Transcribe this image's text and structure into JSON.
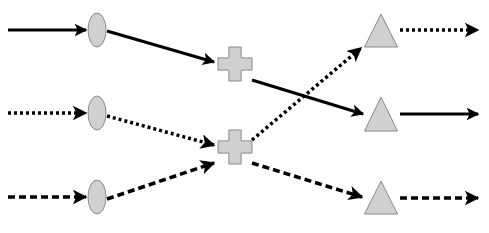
{
  "diagram": {
    "type": "flow-network",
    "colors": {
      "node_fill": "#d0d0d0",
      "node_stroke": "#8a8a8a",
      "edge": "#000000",
      "background": "#ffffff"
    },
    "nodes": [
      {
        "id": "in1",
        "shape": "ellipse",
        "cx": 97,
        "cy": 30,
        "rx": 9,
        "ry": 17
      },
      {
        "id": "in2",
        "shape": "ellipse",
        "cx": 97,
        "cy": 113,
        "rx": 9,
        "ry": 17
      },
      {
        "id": "in3",
        "shape": "ellipse",
        "cx": 97,
        "cy": 197,
        "rx": 9,
        "ry": 17
      },
      {
        "id": "mid1",
        "shape": "cross",
        "cx": 235,
        "cy": 64,
        "size": 34
      },
      {
        "id": "mid2",
        "shape": "cross",
        "cx": 235,
        "cy": 147,
        "size": 34
      },
      {
        "id": "out1",
        "shape": "triangle",
        "cx": 381,
        "top": 14,
        "bottom": 47,
        "width": 33
      },
      {
        "id": "out2",
        "shape": "triangle",
        "cx": 381,
        "top": 97,
        "bottom": 131,
        "width": 33
      },
      {
        "id": "out3",
        "shape": "triangle",
        "cx": 381,
        "top": 181,
        "bottom": 214,
        "width": 33
      }
    ],
    "edges": [
      {
        "id": "src1-in1",
        "style": "solid",
        "x1": 8,
        "y1": 30,
        "x2": 86,
        "y2": 30
      },
      {
        "id": "src2-in2",
        "style": "dotted",
        "x1": 8,
        "y1": 113,
        "x2": 86,
        "y2": 113
      },
      {
        "id": "src3-in3",
        "style": "dashed",
        "x1": 8,
        "y1": 197,
        "x2": 86,
        "y2": 197
      },
      {
        "id": "in1-mid1",
        "style": "solid",
        "x1": 107,
        "y1": 31,
        "x2": 214,
        "y2": 62
      },
      {
        "id": "in2-mid2",
        "style": "dotted",
        "x1": 107,
        "y1": 116,
        "x2": 214,
        "y2": 145
      },
      {
        "id": "in3-mid2",
        "style": "dashed",
        "x1": 107,
        "y1": 199,
        "x2": 214,
        "y2": 163
      },
      {
        "id": "mid1-out2",
        "style": "solid",
        "x1": 252,
        "y1": 80,
        "x2": 363,
        "y2": 114
      },
      {
        "id": "mid2-out1",
        "style": "dotted",
        "x1": 252,
        "y1": 140,
        "x2": 361,
        "y2": 48
      },
      {
        "id": "mid2-out3",
        "style": "dashed",
        "x1": 252,
        "y1": 163,
        "x2": 362,
        "y2": 197
      },
      {
        "id": "out1-sink",
        "style": "dotted",
        "x1": 400,
        "y1": 30,
        "x2": 478,
        "y2": 30
      },
      {
        "id": "out2-sink",
        "style": "solid",
        "x1": 400,
        "y1": 114,
        "x2": 478,
        "y2": 114
      },
      {
        "id": "out3-sink",
        "style": "dashed",
        "x1": 400,
        "y1": 198,
        "x2": 478,
        "y2": 198
      }
    ]
  }
}
